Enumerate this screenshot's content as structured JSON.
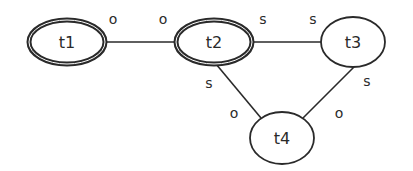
{
  "diagram": {
    "type": "graph",
    "nodes": [
      {
        "id": "t1",
        "label": "t1",
        "cx": 67,
        "cy": 42,
        "rx": 38,
        "ry": 22,
        "emphasized": true
      },
      {
        "id": "t2",
        "label": "t2",
        "cx": 214,
        "cy": 42,
        "rx": 38,
        "ry": 22,
        "emphasized": true
      },
      {
        "id": "t3",
        "label": "t3",
        "cx": 353,
        "cy": 42,
        "rx": 32,
        "ry": 25,
        "emphasized": false
      },
      {
        "id": "t4",
        "label": "t4",
        "cx": 282,
        "cy": 138,
        "rx": 32,
        "ry": 26,
        "emphasized": false
      }
    ],
    "edges": [
      {
        "from": "t1",
        "to": "t2",
        "from_label": "o",
        "to_label": "o"
      },
      {
        "from": "t2",
        "to": "t3",
        "from_label": "s",
        "to_label": "s"
      },
      {
        "from": "t2",
        "to": "t4",
        "from_label": "s",
        "to_label": "o"
      },
      {
        "from": "t3",
        "to": "t4",
        "from_label": "s",
        "to_label": "o"
      }
    ],
    "colors": {
      "stroke": "#2a2a2a",
      "background": "#ffffff"
    }
  }
}
